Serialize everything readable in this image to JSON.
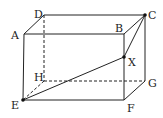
{
  "diagram": {
    "type": "rectangular-prism",
    "vertices": {
      "A": {
        "label": "A",
        "x": 24,
        "y": 34
      },
      "B": {
        "label": "B",
        "x": 124,
        "y": 34
      },
      "C": {
        "label": "C",
        "x": 145,
        "y": 15
      },
      "D": {
        "label": "D",
        "x": 44,
        "y": 15
      },
      "E": {
        "label": "E",
        "x": 23,
        "y": 100
      },
      "F": {
        "label": "F",
        "x": 124,
        "y": 100
      },
      "G": {
        "label": "G",
        "x": 145,
        "y": 81
      },
      "H": {
        "label": "H",
        "x": 44,
        "y": 81
      },
      "X": {
        "label": "X",
        "x": 124,
        "y": 57
      }
    },
    "solid_edges": [
      "AB",
      "AD",
      "DC",
      "BC",
      "AE",
      "BF",
      "CG",
      "EF",
      "FG",
      "EX",
      "XC"
    ],
    "dashed_edges": [
      "DH",
      "HE",
      "HG"
    ],
    "points": [
      "C",
      "X",
      "E"
    ],
    "line_color": "#222222"
  }
}
